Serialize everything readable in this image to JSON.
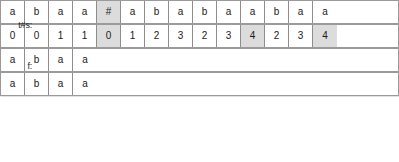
{
  "diagram": {
    "title_text_rows": [
      {
        "id": "text-row",
        "label": "t#s:",
        "cells": [
          {
            "value": "a",
            "highlight": false
          },
          {
            "value": "b",
            "highlight": false
          },
          {
            "value": "a",
            "highlight": false
          },
          {
            "value": "a",
            "highlight": false
          },
          {
            "value": "#",
            "highlight": true
          },
          {
            "value": "a",
            "highlight": false
          },
          {
            "value": "b",
            "highlight": false
          },
          {
            "value": "a",
            "highlight": false
          },
          {
            "value": "b",
            "highlight": false
          },
          {
            "value": "a",
            "highlight": false
          },
          {
            "value": "a",
            "highlight": false
          },
          {
            "value": "b",
            "highlight": false
          },
          {
            "value": "a",
            "highlight": false
          },
          {
            "value": "a",
            "highlight": false
          }
        ]
      },
      {
        "id": "failure-row",
        "label": "f:",
        "cells": [
          {
            "value": "0",
            "highlight": false
          },
          {
            "value": "0",
            "highlight": false
          },
          {
            "value": "1",
            "highlight": false
          },
          {
            "value": "1",
            "highlight": false
          },
          {
            "value": "0",
            "highlight": true
          },
          {
            "value": "1",
            "highlight": false
          },
          {
            "value": "2",
            "highlight": false
          },
          {
            "value": "3",
            "highlight": false
          },
          {
            "value": "2",
            "highlight": false
          },
          {
            "value": "3",
            "highlight": false
          },
          {
            "value": "4",
            "highlight": true
          },
          {
            "value": "2",
            "highlight": false
          },
          {
            "value": "3",
            "highlight": false
          },
          {
            "value": "4",
            "highlight": true
          }
        ]
      }
    ],
    "match_rows": [
      {
        "id": "match-row-1",
        "cells": [
          {
            "value": "a",
            "highlight": false
          },
          {
            "value": "b",
            "highlight": false
          },
          {
            "value": "a",
            "highlight": false
          },
          {
            "value": "a",
            "highlight": false
          }
        ]
      },
      {
        "id": "match-row-2",
        "cells": [
          {
            "value": "a",
            "highlight": false
          },
          {
            "value": "b",
            "highlight": false
          },
          {
            "value": "a",
            "highlight": false
          },
          {
            "value": "a",
            "highlight": false
          }
        ]
      }
    ],
    "colors": {
      "cell_background": "#ffffff",
      "cell_highlight": "#dcdcdc",
      "cell_border": "#8d8d8d",
      "tape_border": "#9a9a9a",
      "text": "#1a1a1a"
    }
  }
}
